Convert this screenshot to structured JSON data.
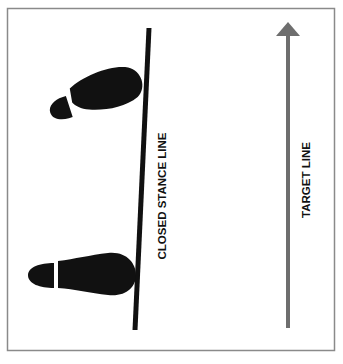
{
  "diagram": {
    "stance_line_label": "CLOSED STANCE LINE",
    "target_line_label": "TARGET LINE",
    "colors": {
      "frame": "#8a8a8a",
      "stance_line": "#111111",
      "footprint": "#111111",
      "target_arrow": "#6e6e6e",
      "label": "#111111"
    }
  }
}
